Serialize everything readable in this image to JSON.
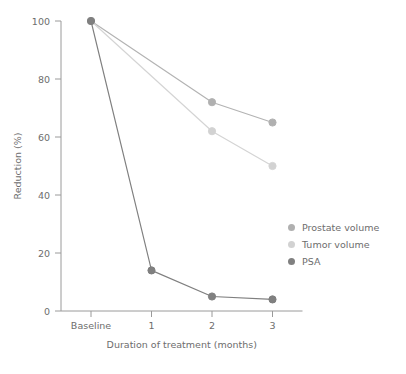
{
  "chart_data": {
    "type": "line",
    "title": "",
    "xlabel": "Duration of treatment (months)",
    "ylabel": "Reduction (%)",
    "categories": [
      "Baseline",
      "1",
      "2",
      "3"
    ],
    "x_tick_labels": [
      "Baseline",
      "1",
      "2",
      "3"
    ],
    "y_tick_labels": [
      "0",
      "20",
      "40",
      "60",
      "80",
      "100"
    ],
    "y_ticks": [
      0,
      20,
      40,
      60,
      80,
      100
    ],
    "ylim": [
      0,
      100
    ],
    "grid": false,
    "legend_position": "right",
    "series": [
      {
        "name": "Prostate volume",
        "values": [
          100,
          null,
          72,
          65
        ],
        "color": "#b3b3b3",
        "marker_color": "#b0b0b0"
      },
      {
        "name": "Tumor volume",
        "values": [
          100,
          null,
          62,
          50
        ],
        "color": "#d4d4d4",
        "marker_color": "#d2d2d2"
      },
      {
        "name": "PSA",
        "values": [
          100,
          14,
          5,
          4
        ],
        "color": "#7f7f7f",
        "marker_color": "#808080"
      }
    ]
  },
  "legend": {
    "items": [
      {
        "label": "Prostate volume",
        "color": "#b0b0b0"
      },
      {
        "label": "Tumor volume",
        "color": "#d2d2d2"
      },
      {
        "label": "PSA",
        "color": "#808080"
      }
    ]
  },
  "axes": {
    "y_title": "Reduction (%)",
    "x_title": "Duration of treatment (months)"
  }
}
